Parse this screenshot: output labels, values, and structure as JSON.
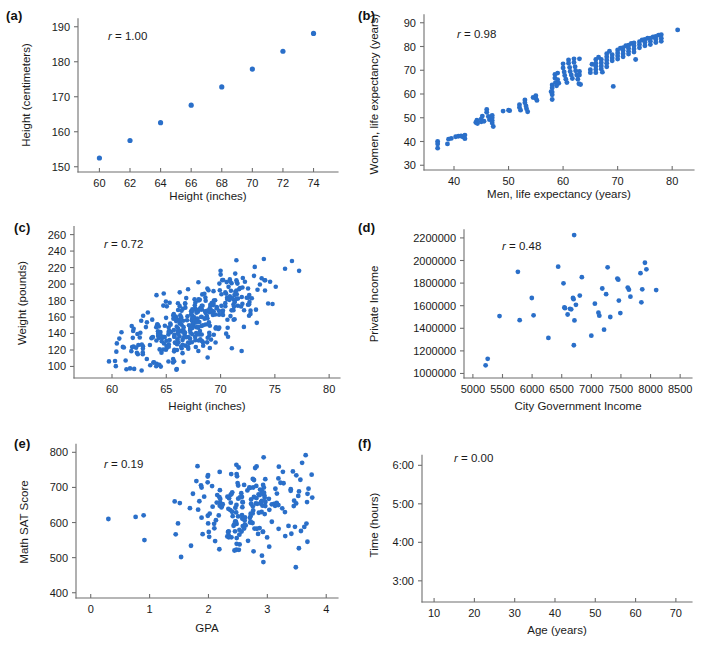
{
  "figure": {
    "background": "#ffffff",
    "dot_color": "#2a6fc9",
    "axis_color": "#6f6f6f"
  },
  "panels": [
    {
      "id": "a",
      "label": "(a)",
      "r_prefix": "r",
      "r_text": " = 1.00",
      "r_value": 1.0,
      "xlabel": "Height (inches)",
      "ylabel": "Height (centimeters)",
      "xticks": [
        60,
        62,
        64,
        66,
        68,
        70,
        72,
        74
      ],
      "yticks": [
        150,
        160,
        170,
        180,
        190
      ],
      "xtick_labels": [
        "60",
        "62",
        "64",
        "66",
        "68",
        "70",
        "72",
        "74"
      ],
      "ytick_labels": [
        "150",
        "160",
        "170",
        "180",
        "190"
      ],
      "xlim": [
        58.6,
        75.6
      ],
      "ylim": [
        148.5,
        192.5
      ]
    },
    {
      "id": "b",
      "label": "(b)",
      "r_prefix": "r",
      "r_text": " = 0.98",
      "r_value": 0.98,
      "xlabel": "Men, life expectancy (years)",
      "ylabel": "Women, life expectancy (years)",
      "xticks": [
        40,
        50,
        60,
        70,
        80
      ],
      "yticks": [
        30,
        40,
        50,
        60,
        70,
        80,
        90
      ],
      "xtick_labels": [
        "40",
        "50",
        "60",
        "70",
        "80"
      ],
      "ytick_labels": [
        "30",
        "40",
        "50",
        "60",
        "70",
        "80",
        "90"
      ],
      "xlim": [
        34.5,
        84.0
      ],
      "ylim": [
        28.0,
        92.0
      ]
    },
    {
      "id": "c",
      "label": "(c)",
      "r_prefix": "r",
      "r_text": " = 0.72",
      "r_value": 0.72,
      "xlabel": "Height (inches)",
      "ylabel": "Weight (pounds)",
      "xticks": [
        60,
        65,
        70,
        75,
        80
      ],
      "yticks": [
        100,
        120,
        140,
        160,
        180,
        200,
        220,
        240,
        260
      ],
      "xtick_labels": [
        "60",
        "65",
        "70",
        "75",
        "80"
      ],
      "ytick_labels": [
        "100",
        "120",
        "140",
        "160",
        "180",
        "200",
        "220",
        "240",
        "260"
      ],
      "xlim": [
        56.5,
        81.0
      ],
      "ylim": [
        86,
        268
      ]
    },
    {
      "id": "d",
      "label": "(d)",
      "r_prefix": "r",
      "r_text": " = 0.48",
      "r_value": 0.48,
      "xlabel": "City Government Income",
      "ylabel": "Private Income",
      "xticks": [
        5000,
        5500,
        6000,
        6500,
        7000,
        7500,
        8000,
        8500
      ],
      "yticks": [
        1000000,
        1200000,
        1400000,
        1600000,
        1800000,
        2000000,
        2200000
      ],
      "xtick_labels": [
        "5000",
        "5500",
        "6000",
        "6500",
        "7000",
        "7500",
        "8000",
        "8500"
      ],
      "ytick_labels": [
        "1000000",
        "1200000",
        "1400000",
        "1600000",
        "1800000",
        "2000000",
        "2200000"
      ],
      "xlim": [
        4850,
        8700
      ],
      "ylim": [
        960000,
        2270000
      ]
    },
    {
      "id": "e",
      "label": "(e)",
      "r_prefix": "r",
      "r_text": " = 0.19",
      "r_value": 0.19,
      "xlabel": "GPA",
      "ylabel": "Math SAT Score",
      "xticks": [
        0,
        1,
        2,
        3,
        4
      ],
      "yticks": [
        400,
        500,
        600,
        700,
        800
      ],
      "xtick_labels": [
        "0",
        "1",
        "2",
        "3",
        "4"
      ],
      "ytick_labels": [
        "400",
        "500",
        "600",
        "700",
        "800"
      ],
      "xlim": [
        -0.25,
        4.2
      ],
      "ylim": [
        385,
        818
      ]
    },
    {
      "id": "f",
      "label": "(f)",
      "r_prefix": "r",
      "r_text": " = 0.00",
      "r_value": 0.0,
      "xlabel": "Age (years)",
      "ylabel": "Time (hours)",
      "xticks": [
        10,
        20,
        30,
        40,
        50,
        60,
        70
      ],
      "yticks": [
        3,
        4,
        5,
        6
      ],
      "xtick_labels": [
        "10",
        "20",
        "30",
        "40",
        "50",
        "60",
        "70"
      ],
      "ytick_labels": [
        "3:00",
        "4:00",
        "5:00",
        "6:00"
      ],
      "xlim": [
        7,
        74
      ],
      "ylim": [
        2.45,
        6.45
      ]
    }
  ],
  "chart_data": [
    {
      "type": "scatter",
      "panel": "a",
      "title": "",
      "xlabel": "Height (inches)",
      "ylabel": "Height (centimeters)",
      "annotation": "r = 1.00",
      "xlim": [
        58.6,
        75.6
      ],
      "ylim": [
        148.5,
        192.5
      ],
      "grid": false,
      "legend": null,
      "points": [
        [
          60,
          152.5
        ],
        [
          62,
          157.5
        ],
        [
          64,
          162.6
        ],
        [
          66,
          167.6
        ],
        [
          68,
          172.8
        ],
        [
          70,
          177.9
        ],
        [
          72,
          183.0
        ],
        [
          74,
          188.1
        ]
      ]
    },
    {
      "type": "scatter",
      "panel": "b",
      "xlabel": "Men, life expectancy (years)",
      "ylabel": "Women, life expectancy (years)",
      "annotation": "r = 0.98",
      "xlim": [
        34.5,
        84.0
      ],
      "ylim": [
        28.0,
        92.0
      ],
      "grid": false,
      "points": [
        [
          37,
          40
        ],
        [
          37,
          39
        ],
        [
          37,
          37.2
        ],
        [
          38.8,
          39
        ],
        [
          39,
          41
        ],
        [
          39.5,
          41.3
        ],
        [
          40.3,
          42
        ],
        [
          40.8,
          42.2
        ],
        [
          41.3,
          42.3
        ],
        [
          41.6,
          42
        ],
        [
          42,
          42.7
        ],
        [
          42,
          41.2
        ],
        [
          44,
          48
        ],
        [
          44.2,
          49
        ],
        [
          44.3,
          47.6
        ],
        [
          45,
          49.5
        ],
        [
          45,
          48.3
        ],
        [
          45.2,
          50.7
        ],
        [
          45.5,
          48.5
        ],
        [
          46,
          53.5
        ],
        [
          46,
          52.3
        ],
        [
          46.3,
          50.5
        ],
        [
          46.5,
          49.2
        ],
        [
          47,
          51
        ],
        [
          47,
          50
        ],
        [
          47,
          48.8
        ],
        [
          47,
          47.8
        ],
        [
          47.2,
          46.3
        ],
        [
          49,
          52.8
        ],
        [
          50,
          53.2
        ],
        [
          50.2,
          53
        ],
        [
          52,
          55.5
        ],
        [
          52,
          54.3
        ],
        [
          52.2,
          53.2
        ],
        [
          53,
          57.5
        ],
        [
          53,
          56.3
        ],
        [
          53.2,
          55
        ],
        [
          53.3,
          53.8
        ],
        [
          53.5,
          52.5
        ],
        [
          54.5,
          58.5
        ],
        [
          55,
          59.3
        ],
        [
          55,
          58.2
        ],
        [
          55.2,
          57.3
        ],
        [
          57.8,
          61
        ],
        [
          58,
          63.8
        ],
        [
          58,
          62.5
        ],
        [
          58,
          60.8
        ],
        [
          58,
          59.7
        ],
        [
          58,
          57.7
        ],
        [
          58.5,
          68.2
        ],
        [
          58.5,
          66.7
        ],
        [
          58.6,
          64.8
        ],
        [
          58.8,
          63.5
        ],
        [
          59,
          68.8
        ],
        [
          59,
          66
        ],
        [
          59.2,
          64.5
        ],
        [
          60,
          72.7
        ],
        [
          60,
          71
        ],
        [
          60.2,
          69.3
        ],
        [
          60.3,
          67.8
        ],
        [
          60.5,
          66.2
        ],
        [
          60.7,
          64.8
        ],
        [
          61,
          74.3
        ],
        [
          61,
          73
        ],
        [
          61.2,
          71.2
        ],
        [
          61.3,
          69.5
        ],
        [
          61.5,
          68
        ],
        [
          61.7,
          66.5
        ],
        [
          62,
          74.8
        ],
        [
          62,
          73.3
        ],
        [
          62.2,
          71.5
        ],
        [
          62.3,
          69.8
        ],
        [
          62.5,
          68
        ],
        [
          62.7,
          66.2
        ],
        [
          62.9,
          64.3
        ],
        [
          63,
          74.8
        ],
        [
          63,
          69.5
        ],
        [
          63,
          68
        ],
        [
          63.2,
          64
        ],
        [
          65,
          70.2
        ],
        [
          65,
          69
        ],
        [
          65.3,
          72.5
        ],
        [
          66,
          74.5
        ],
        [
          66,
          73
        ],
        [
          66,
          71.7
        ],
        [
          66,
          70.3
        ],
        [
          66,
          69
        ],
        [
          66.5,
          75.5
        ],
        [
          67,
          74.5
        ],
        [
          67,
          73.2
        ],
        [
          67,
          71.8
        ],
        [
          67,
          70.5
        ],
        [
          67.2,
          69.2
        ],
        [
          68,
          77
        ],
        [
          68,
          75.7
        ],
        [
          68,
          74.3
        ],
        [
          68,
          73
        ],
        [
          68,
          71.5
        ],
        [
          68.5,
          78
        ],
        [
          69,
          76.5
        ],
        [
          69,
          75.2
        ],
        [
          69,
          74
        ],
        [
          69.2,
          63.2
        ],
        [
          70,
          78.5
        ],
        [
          70,
          77.3
        ],
        [
          70,
          76
        ],
        [
          70,
          74.7
        ],
        [
          70.5,
          79.3
        ],
        [
          71,
          79.5
        ],
        [
          71,
          78.3
        ],
        [
          71,
          77
        ],
        [
          71,
          75.7
        ],
        [
          71.5,
          80.3
        ],
        [
          72,
          80.5
        ],
        [
          72,
          79.3
        ],
        [
          72,
          78
        ],
        [
          72,
          76.8
        ],
        [
          72.5,
          81.3
        ],
        [
          73,
          81.5
        ],
        [
          73,
          80.3
        ],
        [
          73,
          79
        ],
        [
          73,
          77.7
        ],
        [
          73.3,
          74.5
        ],
        [
          74,
          82
        ],
        [
          74,
          80.8
        ],
        [
          74,
          79.5
        ],
        [
          74.5,
          82.8
        ],
        [
          75,
          83
        ],
        [
          75,
          81.7
        ],
        [
          75,
          80.3
        ],
        [
          75.5,
          83.5
        ],
        [
          76,
          83.5
        ],
        [
          76,
          82.2
        ],
        [
          76,
          80.8
        ],
        [
          76.5,
          84
        ],
        [
          77,
          84.2
        ],
        [
          77,
          83
        ],
        [
          77,
          81.7
        ],
        [
          77.5,
          84.8
        ],
        [
          78,
          85
        ],
        [
          78,
          83.5
        ],
        [
          78,
          82.2
        ],
        [
          81,
          87
        ]
      ]
    },
    {
      "type": "scatter",
      "panel": "c",
      "xlabel": "Height (inches)",
      "ylabel": "Weight (pounds)",
      "annotation": "r = 0.72",
      "xlim": [
        56.5,
        81.0
      ],
      "ylim": [
        86,
        268
      ],
      "grid": false,
      "n_points": 380,
      "note": "dense cloud, positive trend; generated from seeded bivariate normal matching visual spread",
      "gen": {
        "mean_x": 67.2,
        "sd_x": 3.3,
        "mean_y": 152,
        "sd_y": 30,
        "rho": 0.72
      }
    },
    {
      "type": "scatter",
      "panel": "d",
      "xlabel": "City Government Income",
      "ylabel": "Private Income",
      "annotation": "r = 0.48",
      "xlim": [
        4850,
        8700
      ],
      "ylim": [
        960000,
        2270000
      ],
      "grid": false,
      "points": [
        [
          5215,
          1072000
        ],
        [
          5250,
          1130000
        ],
        [
          5450,
          1508000
        ],
        [
          5760,
          1900000
        ],
        [
          5790,
          1472000
        ],
        [
          5995,
          1668000
        ],
        [
          6025,
          1515000
        ],
        [
          6275,
          1315000
        ],
        [
          6440,
          1945000
        ],
        [
          6530,
          1798000
        ],
        [
          6545,
          1585000
        ],
        [
          6555,
          1578000
        ],
        [
          6600,
          1522000
        ],
        [
          6640,
          1572000
        ],
        [
          6660,
          1568000
        ],
        [
          6690,
          1668000
        ],
        [
          6700,
          1658000
        ],
        [
          6705,
          1250000
        ],
        [
          6710,
          2225000
        ],
        [
          6715,
          1470000
        ],
        [
          6740,
          1608000
        ],
        [
          6805,
          1690000
        ],
        [
          6840,
          1852000
        ],
        [
          7000,
          1335000
        ],
        [
          7060,
          1618000
        ],
        [
          7120,
          1538000
        ],
        [
          7135,
          1512000
        ],
        [
          7185,
          1752000
        ],
        [
          7215,
          1388000
        ],
        [
          7250,
          1702000
        ],
        [
          7275,
          1940000
        ],
        [
          7320,
          1500000
        ],
        [
          7440,
          1840000
        ],
        [
          7455,
          1830000
        ],
        [
          7465,
          1645000
        ],
        [
          7490,
          1535000
        ],
        [
          7615,
          1760000
        ],
        [
          7635,
          1742000
        ],
        [
          7660,
          1680000
        ],
        [
          7830,
          1888000
        ],
        [
          7845,
          1630000
        ],
        [
          7860,
          1745000
        ],
        [
          7905,
          1980000
        ],
        [
          7930,
          1922000
        ],
        [
          8095,
          1738000
        ]
      ]
    },
    {
      "type": "scatter",
      "panel": "e",
      "xlabel": "GPA",
      "ylabel": "Math SAT Score",
      "annotation": "r = 0.19",
      "xlim": [
        -0.25,
        4.2
      ],
      "ylim": [
        385,
        818
      ],
      "grid": false,
      "n_points": 210,
      "note": "weak positive association; one outlier near (0.3, 610)",
      "gen": {
        "mean_x": 2.6,
        "sd_x": 0.6,
        "mean_y": 648,
        "sd_y": 68,
        "rho": 0.19
      },
      "outliers": [
        [
          0.3,
          610
        ]
      ]
    },
    {
      "type": "scatter",
      "panel": "f",
      "xlabel": "Age (years)",
      "ylabel": "Time (hours)",
      "annotation": "r = 0.00",
      "xlim": [
        7,
        74
      ],
      "ylim": [
        2.45,
        6.45
      ],
      "grid": false,
      "n_points": 370,
      "note": "no association, round blob centered near age 38, time 4:00",
      "gen": {
        "mean_x": 38,
        "sd_x": 9.5,
        "mean_y": 3.95,
        "sd_y": 0.52,
        "rho": 0.0
      }
    }
  ]
}
